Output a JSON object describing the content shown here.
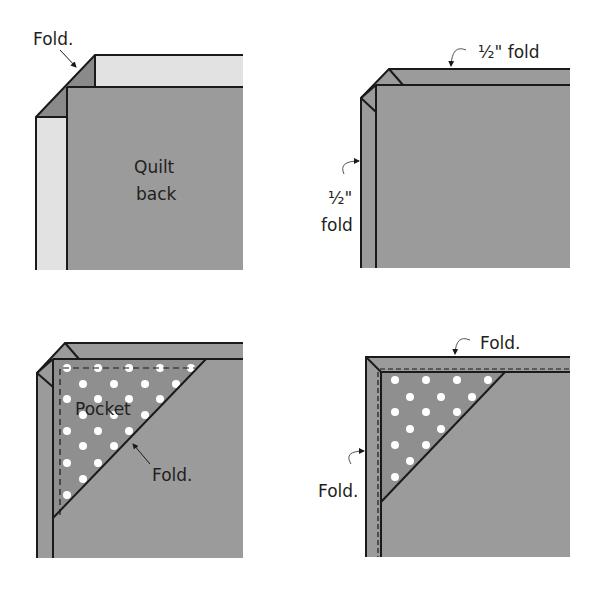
{
  "colors": {
    "fabric": "#9b9b9b",
    "fabric_fold": "#8a8a8a",
    "light_strip": "#e2e2e2",
    "outline": "#1a1a1a",
    "dots": "#ffffff",
    "text": "#231f20"
  },
  "panels": [
    {
      "id": "step-1",
      "labels": {
        "fold": "Fold.",
        "quilt_back_line1": "Quilt",
        "quilt_back_line2": "back"
      }
    },
    {
      "id": "step-2",
      "labels": {
        "top_fold": "½\" fold",
        "side_fold_line1": "½\"",
        "side_fold_line2": "fold"
      }
    },
    {
      "id": "step-3",
      "labels": {
        "pocket": "Pocket",
        "fold": "Fold."
      }
    },
    {
      "id": "step-4",
      "labels": {
        "top_fold": "Fold.",
        "side_fold": "Fold."
      }
    }
  ]
}
